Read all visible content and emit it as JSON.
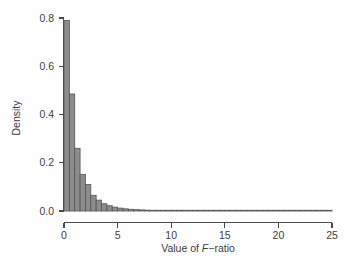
{
  "chart_data": {
    "type": "bar",
    "title": "",
    "subtitle": "",
    "xlabel_prefix": "Value of ",
    "xlabel_italic": "F",
    "xlabel_suffix": "−ratio",
    "xlabel": "Value of F−ratio",
    "ylabel": "Density",
    "xlim": [
      0,
      25
    ],
    "ylim": [
      0,
      0.8
    ],
    "xticks": [
      0,
      5,
      10,
      15,
      20,
      25
    ],
    "xtick_labels": [
      "0",
      "5",
      "10",
      "15",
      "20",
      "25"
    ],
    "yticks": [
      0.0,
      0.2,
      0.4,
      0.6,
      0.8
    ],
    "ytick_labels": [
      "0.0",
      "0.2",
      "0.4",
      "0.6",
      "0.8"
    ],
    "grid": false,
    "legend": false,
    "bin_width": 0.5,
    "bar_fill_color": "#8c8c8c",
    "bar_border_color": "#555555",
    "axis_color": "#4a4a4a",
    "background_color": "#fefefe",
    "bin_starts": [
      0.0,
      0.5,
      1.0,
      1.5,
      2.0,
      2.5,
      3.0,
      3.5,
      4.0,
      4.5,
      5.0,
      5.5,
      6.0,
      6.5,
      7.0,
      7.5,
      8.0,
      8.5,
      9.0,
      9.5,
      10.0,
      10.5,
      11.0,
      11.5,
      12.0,
      12.5,
      13.0,
      13.5,
      14.0,
      14.5,
      15.0,
      15.5,
      16.0,
      16.5,
      17.0,
      17.5,
      18.0,
      18.5,
      19.0,
      19.5,
      20.0,
      20.5,
      21.0,
      21.5,
      22.0,
      22.5,
      23.0,
      23.5,
      24.0,
      24.5
    ],
    "categories": [
      "0.0–0.5",
      "0.5–1.0",
      "1.0–1.5",
      "1.5–2.0",
      "2.0–2.5",
      "2.5–3.0",
      "3.0–3.5",
      "3.5–4.0",
      "4.0–4.5",
      "4.5–5.0",
      "5.0–5.5",
      "5.5–6.0",
      "6.0–6.5",
      "6.5–7.0",
      "7.0–7.5",
      "7.5–8.0",
      "8.0–8.5",
      "8.5–9.0",
      "9.0–9.5",
      "9.5–10.0",
      "10.0–10.5",
      "10.5–11.0",
      "11.0–11.5",
      "11.5–12.0",
      "12.0–12.5",
      "12.5–13.0",
      "13.0–13.5",
      "13.5–14.0",
      "14.0–14.5",
      "14.5–15.0",
      "15.0–15.5",
      "15.5–16.0",
      "16.0–16.5",
      "16.5–17.0",
      "17.0–17.5",
      "17.5–18.0",
      "18.0–18.5",
      "18.5–19.0",
      "19.0–19.5",
      "19.5–20.0",
      "20.0–20.5",
      "20.5–21.0",
      "21.0–21.5",
      "21.5–22.0",
      "22.0–22.5",
      "22.5–23.0",
      "23.0–23.5",
      "23.5–24.0",
      "24.0–24.5",
      "24.5–25.0"
    ],
    "values": [
      0.79,
      0.485,
      0.26,
      0.152,
      0.11,
      0.065,
      0.045,
      0.03,
      0.022,
      0.016,
      0.012,
      0.009,
      0.007,
      0.0055,
      0.0045,
      0.0035,
      0.0028,
      0.0022,
      0.0018,
      0.0015,
      0.0012,
      0.001,
      0.0009,
      0.0008,
      0.0007,
      0.0006,
      0.0005,
      0.00045,
      0.0004,
      0.00035,
      0.0003,
      0.00028,
      0.00025,
      0.00022,
      0.0002,
      0.00018,
      0.00016,
      0.00015,
      0.00013,
      0.00012,
      0.00011,
      0.0001,
      9e-05,
      8e-05,
      7e-05,
      6e-05,
      5e-05,
      4e-05,
      3e-05,
      2e-05
    ]
  }
}
